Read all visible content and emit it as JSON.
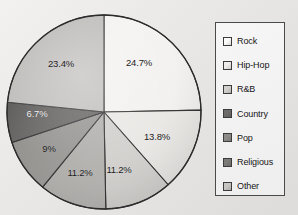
{
  "chart_data": {
    "type": "pie",
    "title": "",
    "categories": [
      "Rock",
      "Hip-Hop",
      "R&B",
      "Country",
      "Pop",
      "Religious",
      "Other"
    ],
    "legend_position": "right",
    "start_angle_deg": 0,
    "direction": "clockwise",
    "slices": [
      {
        "label": "Rock",
        "value": 24.7,
        "display": "24.7%",
        "color": "#f3f2f0",
        "label_on_dark": false,
        "label_x": 139,
        "label_y": 62
      },
      {
        "label": "Hip-Hop",
        "value": 13.8,
        "display": "13.8%",
        "color": "#e9e7e4",
        "label_on_dark": false,
        "label_x": 157,
        "label_y": 136
      },
      {
        "label": "R&B",
        "value": 11.2,
        "display": "11.2%",
        "color": "#cfcdca",
        "label_on_dark": false,
        "label_x": 119,
        "label_y": 169
      },
      {
        "label": "Country",
        "value": 11.2,
        "display": "11.2%",
        "color": "#a8a6a3",
        "label_on_dark": false,
        "label_x": 80,
        "label_y": 172
      },
      {
        "label": "Pop",
        "value": 9.0,
        "display": "9%",
        "color": "#8a8885",
        "label_on_dark": false,
        "label_x": 49,
        "label_y": 148
      },
      {
        "label": "Religious",
        "value": 6.7,
        "display": "6.7%",
        "color": "#4e4c4a",
        "label_on_dark": true,
        "label_x": 37,
        "label_y": 113
      },
      {
        "label": "Other",
        "value": 23.4,
        "display": "23.4%",
        "color": "#b4b2af",
        "label_on_dark": false,
        "label_x": 61,
        "label_y": 63
      }
    ],
    "legend_entries": [
      {
        "label": "Rock",
        "color": "#fbfbfa"
      },
      {
        "label": "Hip-Hop",
        "color": "#eeeceb"
      },
      {
        "label": "R&B",
        "color": "#d2d0cd"
      },
      {
        "label": "Country",
        "color": "#6e6c6a"
      },
      {
        "label": "Pop",
        "color": "#8e8c89"
      },
      {
        "label": "Religious",
        "color": "#7d7b78"
      },
      {
        "label": "Other",
        "color": "#c8c6c3"
      }
    ],
    "geometry": {
      "center_x": 104,
      "center_y": 112,
      "radius": 97,
      "outline_color": "#2c2c2c"
    }
  }
}
